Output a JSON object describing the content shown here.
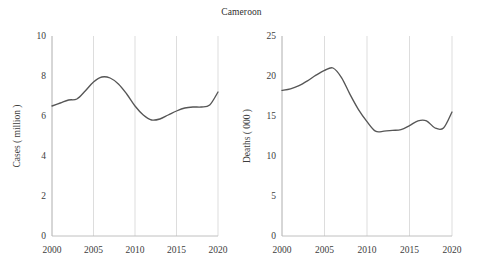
{
  "title": "Cameroon",
  "chart_data": [
    {
      "type": "line",
      "id": "cases",
      "title": "Cameroon",
      "xlabel": "",
      "ylabel": "Cases ( million )",
      "xlim": [
        2000,
        2020
      ],
      "ylim": [
        0,
        10
      ],
      "yticks": [
        "0",
        "2",
        "4",
        "6",
        "8",
        "10"
      ],
      "ytick_values": [
        0,
        2,
        4,
        6,
        8,
        10
      ],
      "xticks": [
        "2000",
        "2005",
        "2010",
        "2015",
        "2020"
      ],
      "xtick_values": [
        2000,
        2005,
        2010,
        2015,
        2020
      ],
      "grid": "vertical",
      "legend": "none",
      "series": [
        {
          "name": "Cases ( million )",
          "color": "#565656",
          "x": [
            2000,
            2001,
            2002,
            2003,
            2004,
            2005,
            2006,
            2007,
            2008,
            2009,
            2010,
            2011,
            2012,
            2013,
            2014,
            2015,
            2016,
            2017,
            2018,
            2019,
            2020
          ],
          "values": [
            6.5,
            6.65,
            6.8,
            6.85,
            7.25,
            7.7,
            7.95,
            7.9,
            7.6,
            7.1,
            6.5,
            6.05,
            5.8,
            5.85,
            6.05,
            6.25,
            6.4,
            6.45,
            6.45,
            6.55,
            7.2
          ]
        }
      ]
    },
    {
      "type": "line",
      "id": "deaths",
      "title": "Cameroon",
      "xlabel": "",
      "ylabel": "Deaths ( 000 )",
      "xlim": [
        2000,
        2020
      ],
      "ylim": [
        0,
        25
      ],
      "yticks": [
        "0",
        "5",
        "10",
        "15",
        "20",
        "25"
      ],
      "ytick_values": [
        0,
        5,
        10,
        15,
        20,
        25
      ],
      "xticks": [
        "2000",
        "2005",
        "2010",
        "2015",
        "2020"
      ],
      "xtick_values": [
        2000,
        2005,
        2010,
        2015,
        2020
      ],
      "grid": "vertical",
      "legend": "none",
      "series": [
        {
          "name": "Deaths ( 000 )",
          "color": "#565656",
          "x": [
            2000,
            2001,
            2002,
            2003,
            2004,
            2005,
            2006,
            2007,
            2008,
            2009,
            2010,
            2011,
            2012,
            2013,
            2014,
            2015,
            2016,
            2017,
            2018,
            2019,
            2020
          ],
          "values": [
            18.2,
            18.4,
            18.8,
            19.4,
            20.1,
            20.7,
            21.0,
            19.8,
            17.7,
            15.8,
            14.3,
            13.1,
            13.1,
            13.2,
            13.3,
            13.8,
            14.4,
            14.4,
            13.5,
            13.5,
            15.5
          ]
        }
      ]
    }
  ]
}
